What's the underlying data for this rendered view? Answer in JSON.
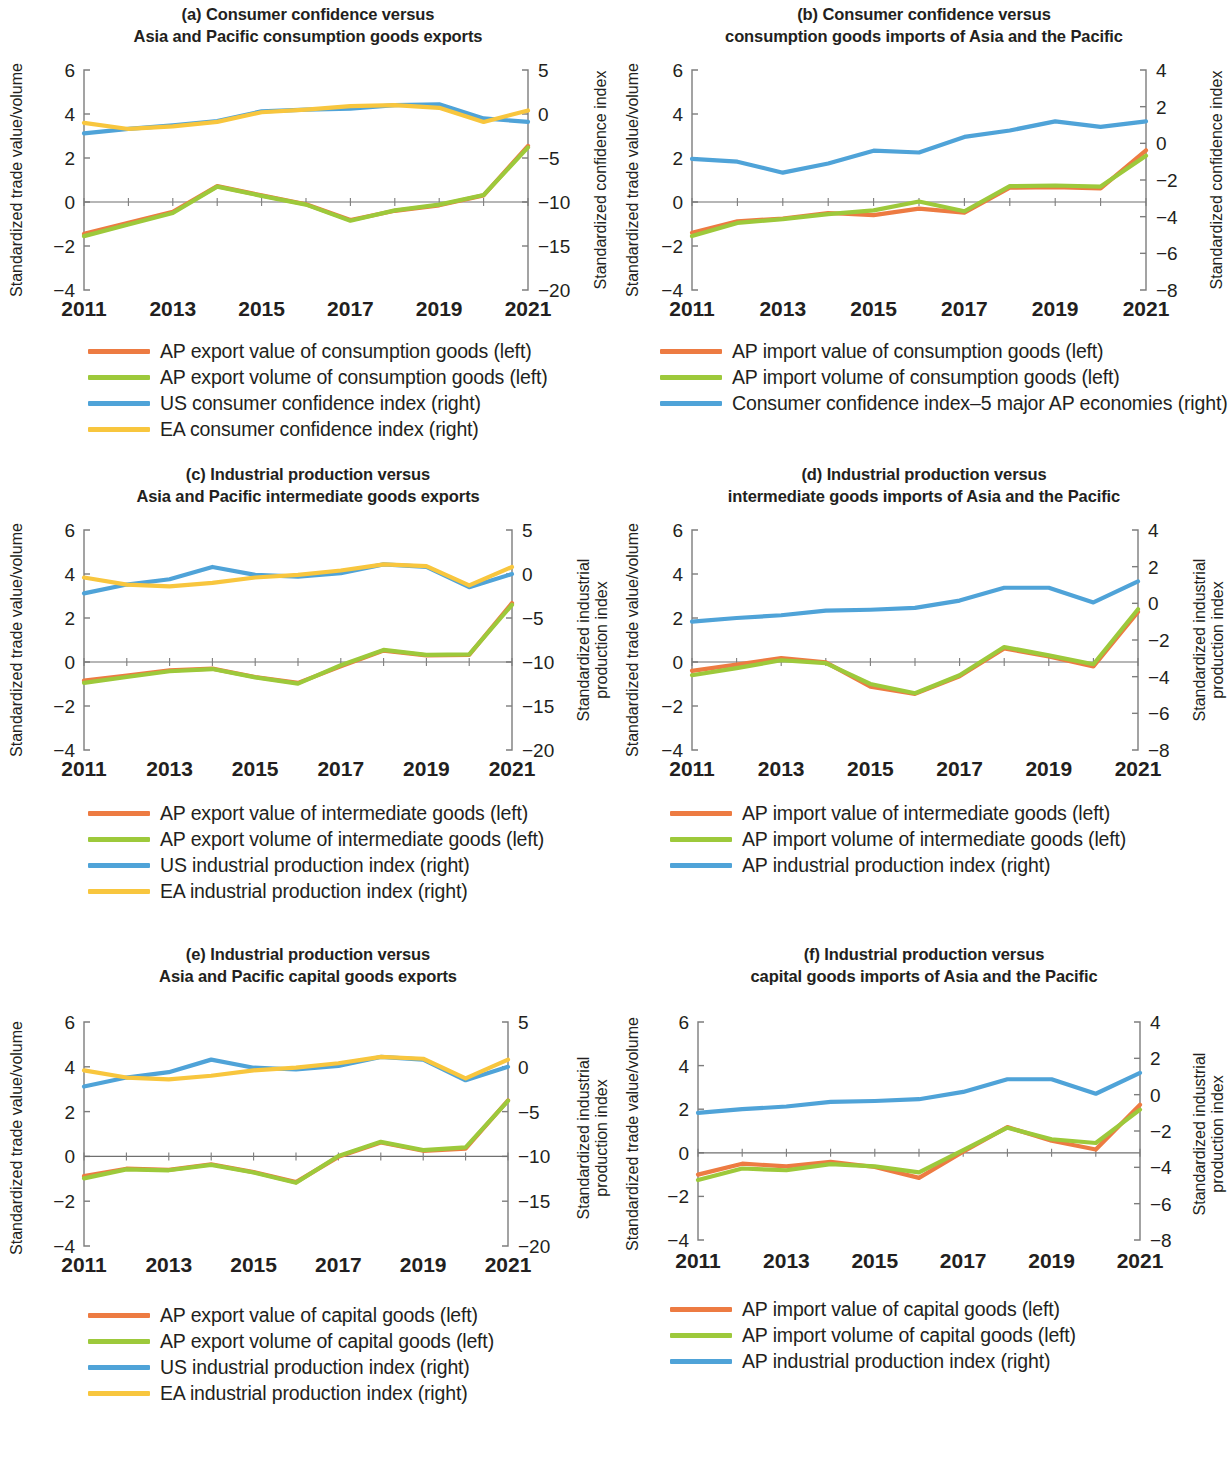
{
  "figure": {
    "colors": {
      "value_orange": "#ED7B42",
      "volume_green": "#9DC93B",
      "index_blue": "#4FA3D8",
      "index_yellow": "#F8C63E",
      "axis": "#7d7d7d",
      "text": "#231f20"
    },
    "x_tick_labels": [
      "2011",
      "2013",
      "2015",
      "2017",
      "2019",
      "2021"
    ],
    "x_tick_years": [
      2011,
      2013,
      2015,
      2017,
      2019,
      2021
    ]
  },
  "panels": [
    {
      "id": "a",
      "title_line1": "(a) Consumer confidence versus",
      "title_line2": "Asia and Pacific consumption goods exports",
      "left_axis_title": "Standardized trade value/volume",
      "right_axis_title": "Standardized confidence index",
      "left_ticks": [
        "6",
        "4",
        "2",
        "0",
        "-2",
        "-4"
      ],
      "right_ticks": [
        "5",
        "0",
        "-5",
        "-10",
        "-15",
        "-20"
      ],
      "legend": [
        {
          "label": "AP export value of consumption goods (left)",
          "color": "#ED7B42"
        },
        {
          "label": "AP export volume of consumption goods (left)",
          "color": "#9DC93B"
        },
        {
          "label": "US consumer confidence index (right)",
          "color": "#4FA3D8"
        },
        {
          "label": "EA consumer confidence index (right)",
          "color": "#F8C63E"
        }
      ]
    },
    {
      "id": "b",
      "title_line1": "(b) Consumer confidence versus",
      "title_line2": "consumption goods imports of Asia and the Pacific",
      "left_axis_title": "Standardized trade value/volume",
      "right_axis_title": "Standardized confidence index",
      "left_ticks": [
        "6",
        "4",
        "2",
        "0",
        "-2",
        "-4"
      ],
      "right_ticks": [
        "4",
        "2",
        "0",
        "-2",
        "-4",
        "-6",
        "-8"
      ],
      "legend": [
        {
          "label": "AP import value of consumption goods (left)",
          "color": "#ED7B42"
        },
        {
          "label": "AP import volume of consumption goods (left)",
          "color": "#9DC93B"
        },
        {
          "label": "Consumer confidence index–5 major AP economies (right)",
          "color": "#4FA3D8"
        }
      ]
    },
    {
      "id": "c",
      "title_line1": "(c) Industrial production versus",
      "title_line2": "Asia and Pacific intermediate goods exports",
      "left_axis_title": "Standardized trade value/volume",
      "right_axis_title": "Standardized industrial\nproduction index",
      "left_ticks": [
        "6",
        "4",
        "2",
        "0",
        "-2",
        "-4"
      ],
      "right_ticks": [
        "5",
        "0",
        "-5",
        "-10",
        "-15",
        "-20"
      ],
      "legend": [
        {
          "label": "AP export value of intermediate goods (left)",
          "color": "#ED7B42"
        },
        {
          "label": "AP export volume of intermediate goods (left)",
          "color": "#9DC93B"
        },
        {
          "label": "US industrial production index (right)",
          "color": "#4FA3D8"
        },
        {
          "label": "EA industrial production index (right)",
          "color": "#F8C63E"
        }
      ]
    },
    {
      "id": "d",
      "title_line1": "(d) Industrial production versus",
      "title_line2": "intermediate goods imports of Asia and the Pacific",
      "left_axis_title": "Standardized trade value/volume",
      "right_axis_title": "Standardized industrial\nproduction index",
      "left_ticks": [
        "6",
        "4",
        "2",
        "0",
        "-2",
        "-4"
      ],
      "right_ticks": [
        "4",
        "2",
        "0",
        "-2",
        "-4",
        "-6",
        "-8"
      ],
      "legend": [
        {
          "label": "AP import value of intermediate goods (left)",
          "color": "#ED7B42"
        },
        {
          "label": "AP import volume of intermediate goods (left)",
          "color": "#9DC93B"
        },
        {
          "label": "AP industrial production index (right)",
          "color": "#4FA3D8"
        }
      ]
    },
    {
      "id": "e",
      "title_line1": "(e) Industrial production versus",
      "title_line2": "Asia and Pacific capital goods exports",
      "left_axis_title": "Standardized trade value/volume",
      "right_axis_title": "Standardized industrial\nproduction index",
      "left_ticks": [
        "6",
        "4",
        "2",
        "0",
        "-2",
        "-4"
      ],
      "right_ticks": [
        "5",
        "0",
        "-5",
        "-10",
        "-15",
        "-20"
      ],
      "legend": [
        {
          "label": "AP export value of capital goods (left)",
          "color": "#ED7B42"
        },
        {
          "label": "AP export volume of capital goods (left)",
          "color": "#9DC93B"
        },
        {
          "label": "US industrial production index (right)",
          "color": "#4FA3D8"
        },
        {
          "label": "EA industrial production index (right)",
          "color": "#F8C63E"
        }
      ]
    },
    {
      "id": "f",
      "title_line1": "(f) Industrial production versus",
      "title_line2": "capital goods imports of Asia and the Pacific",
      "left_axis_title": "Standardized trade value/volume",
      "right_axis_title": "Standardized industrial\nproduction index",
      "left_ticks": [
        "6",
        "4",
        "2",
        "0",
        "-2",
        "-4"
      ],
      "right_ticks": [
        "4",
        "2",
        "0",
        "-2",
        "-4",
        "-6",
        "-8"
      ],
      "legend": [
        {
          "label": "AP import value of capital goods (left)",
          "color": "#ED7B42"
        },
        {
          "label": "AP import volume of capital goods (left)",
          "color": "#9DC93B"
        },
        {
          "label": "AP industrial production index (right)",
          "color": "#4FA3D8"
        }
      ]
    }
  ],
  "chart_data": [
    {
      "type": "line",
      "panel": "a",
      "title": "(a) Consumer confidence versus Asia and Pacific consumption goods exports",
      "xlabel": "",
      "ylabel": "Standardized trade value/volume",
      "y2label": "Standardized confidence index",
      "x": [
        2011,
        2012,
        2013,
        2014,
        2015,
        2016,
        2017,
        2018,
        2019,
        2020,
        2021
      ],
      "ylim": [
        -4,
        6
      ],
      "y2lim": [
        -20,
        5
      ],
      "grid": false,
      "legend_position": "below",
      "series": [
        {
          "name": "AP export value of consumption goods (left)",
          "axis": "left",
          "color": "#ED7B42",
          "values": [
            -1.45,
            -0.95,
            -0.45,
            0.72,
            0.3,
            -0.1,
            -0.82,
            -0.4,
            -0.15,
            0.3,
            2.55
          ]
        },
        {
          "name": "AP export volume of consumption goods (left)",
          "axis": "left",
          "color": "#9DC93B",
          "values": [
            -1.55,
            -1.02,
            -0.5,
            0.7,
            0.28,
            -0.12,
            -0.85,
            -0.38,
            -0.12,
            0.32,
            2.48
          ]
        },
        {
          "name": "US consumer confidence index (right)",
          "axis": "right",
          "color": "#4FA3D8",
          "values": [
            -2.2,
            -1.7,
            -1.3,
            -0.8,
            0.3,
            0.5,
            0.6,
            1.0,
            1.1,
            -0.5,
            -0.9
          ]
        },
        {
          "name": "EA consumer confidence index (right)",
          "axis": "right",
          "color": "#F8C63E",
          "values": [
            -1.0,
            -1.7,
            -1.4,
            -0.9,
            0.2,
            0.5,
            0.9,
            1.0,
            0.7,
            -0.9,
            0.4
          ]
        }
      ]
    },
    {
      "type": "line",
      "panel": "b",
      "title": "(b) Consumer confidence versus consumption goods imports of Asia and the Pacific",
      "xlabel": "",
      "ylabel": "Standardized trade value/volume",
      "y2label": "Standardized confidence index",
      "x": [
        2011,
        2012,
        2013,
        2014,
        2015,
        2016,
        2017,
        2018,
        2019,
        2020,
        2021
      ],
      "ylim": [
        -4,
        6
      ],
      "y2lim": [
        -8,
        4
      ],
      "grid": false,
      "legend_position": "below",
      "series": [
        {
          "name": "AP import value of consumption goods (left)",
          "axis": "left",
          "color": "#ED7B42",
          "values": [
            -1.4,
            -0.88,
            -0.75,
            -0.5,
            -0.6,
            -0.3,
            -0.48,
            0.65,
            0.68,
            0.62,
            2.35
          ]
        },
        {
          "name": "AP import volume of consumption goods (left)",
          "axis": "left",
          "color": "#9DC93B",
          "values": [
            -1.55,
            -0.95,
            -0.78,
            -0.55,
            -0.38,
            0.02,
            -0.42,
            0.72,
            0.75,
            0.7,
            2.1
          ]
        },
        {
          "name": "Consumer confidence index–5 major AP economies (right)",
          "axis": "right",
          "color": "#4FA3D8",
          "values": [
            -0.85,
            -1.0,
            -1.6,
            -1.1,
            -0.4,
            -0.5,
            0.35,
            0.7,
            1.2,
            0.9,
            1.2
          ]
        }
      ]
    },
    {
      "type": "line",
      "panel": "c",
      "title": "(c) Industrial production versus Asia and Pacific intermediate goods exports",
      "xlabel": "",
      "ylabel": "Standardized trade value/volume",
      "y2label": "Standardized industrial production index",
      "x": [
        2011,
        2012,
        2013,
        2014,
        2015,
        2016,
        2017,
        2018,
        2019,
        2020,
        2021
      ],
      "ylim": [
        -4,
        6
      ],
      "y2lim": [
        -20,
        5
      ],
      "grid": false,
      "legend_position": "below",
      "series": [
        {
          "name": "AP export value of intermediate goods (left)",
          "axis": "left",
          "color": "#ED7B42",
          "values": [
            -0.85,
            -0.62,
            -0.38,
            -0.3,
            -0.68,
            -0.95,
            -0.2,
            0.52,
            0.3,
            0.32,
            2.68
          ]
        },
        {
          "name": "AP export volume of intermediate goods (left)",
          "axis": "left",
          "color": "#9DC93B",
          "values": [
            -0.95,
            -0.68,
            -0.42,
            -0.32,
            -0.7,
            -0.98,
            -0.15,
            0.55,
            0.32,
            0.35,
            2.6
          ]
        },
        {
          "name": "US industrial production index (right)",
          "axis": "right",
          "color": "#4FA3D8",
          "values": [
            -2.2,
            -1.2,
            -0.6,
            0.8,
            -0.1,
            -0.3,
            0.1,
            1.1,
            0.8,
            -1.5,
            0.0
          ]
        },
        {
          "name": "EA industrial production index (right)",
          "axis": "right",
          "color": "#F8C63E",
          "values": [
            -0.4,
            -1.2,
            -1.4,
            -1.0,
            -0.4,
            -0.1,
            0.4,
            1.1,
            0.9,
            -1.3,
            0.8
          ]
        }
      ]
    },
    {
      "type": "line",
      "panel": "d",
      "title": "(d) Industrial production versus intermediate goods imports of Asia and the Pacific",
      "xlabel": "",
      "ylabel": "Standardized trade value/volume",
      "y2label": "Standardized industrial production index",
      "x": [
        2011,
        2012,
        2013,
        2014,
        2015,
        2016,
        2017,
        2018,
        2019,
        2020,
        2021
      ],
      "ylim": [
        -4,
        6
      ],
      "y2lim": [
        -8,
        4
      ],
      "grid": false,
      "legend_position": "below",
      "series": [
        {
          "name": "AP import value of intermediate goods (left)",
          "axis": "left",
          "color": "#ED7B42",
          "values": [
            -0.4,
            -0.12,
            0.18,
            -0.02,
            -1.12,
            -1.45,
            -0.65,
            0.62,
            0.25,
            -0.2,
            2.28
          ]
        },
        {
          "name": "AP import volume of intermediate goods (left)",
          "axis": "left",
          "color": "#9DC93B",
          "values": [
            -0.6,
            -0.28,
            0.08,
            -0.05,
            -1.0,
            -1.42,
            -0.6,
            0.68,
            0.3,
            -0.1,
            2.4
          ]
        },
        {
          "name": "AP industrial production index (right)",
          "axis": "right",
          "color": "#4FA3D8",
          "values": [
            -1.0,
            -0.8,
            -0.65,
            -0.4,
            -0.35,
            -0.25,
            0.15,
            0.85,
            0.85,
            0.05,
            1.2
          ]
        }
      ]
    },
    {
      "type": "line",
      "panel": "e",
      "title": "(e) Industrial production versus Asia and Pacific capital goods exports",
      "xlabel": "",
      "ylabel": "Standardized trade value/volume",
      "y2label": "Standardized industrial production index",
      "x": [
        2011,
        2012,
        2013,
        2014,
        2015,
        2016,
        2017,
        2018,
        2019,
        2020,
        2021
      ],
      "ylim": [
        -4,
        6
      ],
      "y2lim": [
        -20,
        5
      ],
      "grid": false,
      "legend_position": "below",
      "series": [
        {
          "name": "AP export value of capital goods (left)",
          "axis": "left",
          "color": "#ED7B42",
          "values": [
            -0.88,
            -0.55,
            -0.6,
            -0.35,
            -0.7,
            -1.15,
            -0.02,
            0.62,
            0.25,
            0.35,
            2.5
          ]
        },
        {
          "name": "AP export volume of capital goods (left)",
          "axis": "left",
          "color": "#9DC93B",
          "values": [
            -0.98,
            -0.58,
            -0.62,
            -0.38,
            -0.72,
            -1.18,
            0.02,
            0.65,
            0.28,
            0.4,
            2.48
          ]
        },
        {
          "name": "US industrial production index (right)",
          "axis": "right",
          "color": "#4FA3D8",
          "values": [
            -2.2,
            -1.2,
            -0.6,
            0.8,
            -0.1,
            -0.3,
            0.1,
            1.1,
            0.8,
            -1.5,
            0.0
          ]
        },
        {
          "name": "EA industrial production index (right)",
          "axis": "right",
          "color": "#F8C63E",
          "values": [
            -0.4,
            -1.2,
            -1.4,
            -1.0,
            -0.4,
            -0.1,
            0.4,
            1.1,
            0.9,
            -1.3,
            0.8
          ]
        }
      ]
    },
    {
      "type": "line",
      "panel": "f",
      "title": "(f) Industrial production versus capital goods imports of Asia and the Pacific",
      "xlabel": "",
      "ylabel": "Standardized trade value/volume",
      "y2label": "Standardized industrial production index",
      "x": [
        2011,
        2012,
        2013,
        2014,
        2015,
        2016,
        2017,
        2018,
        2019,
        2020,
        2021
      ],
      "ylim": [
        -4,
        6
      ],
      "y2lim": [
        -8,
        4
      ],
      "grid": false,
      "legend_position": "below",
      "series": [
        {
          "name": "AP import value of capital goods (left)",
          "axis": "left",
          "color": "#ED7B42",
          "values": [
            -1.0,
            -0.5,
            -0.62,
            -0.42,
            -0.65,
            -1.15,
            0.05,
            1.18,
            0.55,
            0.15,
            2.2
          ]
        },
        {
          "name": "AP import volume of capital goods (left)",
          "axis": "left",
          "color": "#9DC93B",
          "values": [
            -1.25,
            -0.72,
            -0.8,
            -0.52,
            -0.62,
            -0.9,
            0.12,
            1.15,
            0.62,
            0.45,
            1.98
          ]
        },
        {
          "name": "AP industrial production index (right)",
          "axis": "right",
          "color": "#4FA3D8",
          "values": [
            -1.0,
            -0.8,
            -0.65,
            -0.4,
            -0.35,
            -0.25,
            0.15,
            0.85,
            0.85,
            0.05,
            1.2
          ]
        }
      ]
    }
  ]
}
